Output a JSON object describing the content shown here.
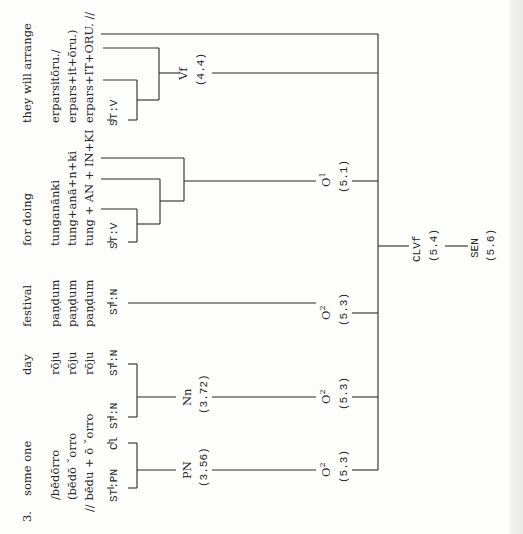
{
  "example_number": "3.",
  "orientation": "rotated-90-ccw",
  "line_color": "#2a2a2a",
  "constituents": [
    {
      "gloss": "they will arrange",
      "forms": [
        "erparsitōru./",
        "erpars+it+ōru.)",
        "erpars+IT+ORU. //"
      ],
      "stem_label": "ST:V",
      "node": {
        "label": "Vf",
        "ref": "(4.4)"
      }
    },
    {
      "gloss": "for doing",
      "forms": [
        "tunganānki",
        "tung+anā+n+ki",
        "tung + AN + IN+KI"
      ],
      "stem_label": "ST:V",
      "node": {
        "label": "O",
        "sup": "1",
        "ref": "(5.1)"
      }
    },
    {
      "gloss": "festival",
      "forms": [
        "paṇḍum",
        "paṇḍum",
        "paṇḍum"
      ],
      "stem_label": "ST:N",
      "node": {
        "label": "O",
        "sup": "2",
        "ref": "(5.3)"
      }
    },
    {
      "gloss": "day",
      "forms": [
        "rōju",
        "rōju",
        "rōju"
      ],
      "stem_label": "ST:N",
      "sub_node": {
        "label": "Nn",
        "ref": "(3.72)"
      },
      "node": {
        "label": "O",
        "sup": "2",
        "ref": "(5.3)"
      }
    },
    {
      "gloss": "some one",
      "forms": [
        "/bēdōrro",
        "(bēdō ˇorro",
        "// bēdu + ō ˇorro"
      ],
      "stem_labels": [
        "ST:PN",
        "Cl",
        "ST:N"
      ],
      "sub_node": {
        "label": "PN",
        "ref": "(3.56)"
      },
      "node": {
        "label": "O",
        "sup": "2",
        "ref": "(5.3)"
      }
    }
  ],
  "clause": {
    "label": "CLVf",
    "ref": "(5.4)"
  },
  "sentence": {
    "label": "SEN",
    "ref": "(5.6)"
  }
}
